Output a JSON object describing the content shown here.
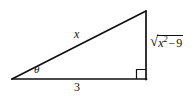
{
  "figure": {
    "type": "right-triangle-diagram",
    "canvas": {
      "width": 195,
      "height": 103,
      "background": "#ffffff"
    },
    "stroke_color": "#111111",
    "vertices": {
      "left": {
        "x": 12,
        "y": 79
      },
      "right_angle": {
        "x": 146,
        "y": 79
      },
      "apex": {
        "x": 146,
        "y": 11
      }
    },
    "right_angle_marker": {
      "size": 9,
      "present": true
    },
    "labels": {
      "hypotenuse": "x",
      "angle": "θ",
      "adjacent": "3",
      "opposite": {
        "radical_sign": "√",
        "radicand_variable": "x",
        "radicand_exponent": "2",
        "radicand_operator": "−",
        "radicand_constant": "9",
        "full_text": "√(x² − 9)"
      }
    }
  }
}
